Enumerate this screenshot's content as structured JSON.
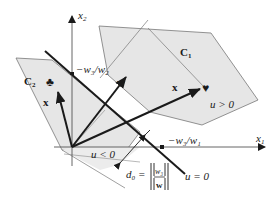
{
  "diagram": {
    "axes": {
      "x1_label": "x",
      "x1_sub": "1",
      "x2_label": "x",
      "x2_sub": "2"
    },
    "classes": {
      "c1_label": "C",
      "c1_sub": "1",
      "c2_label": "C",
      "c2_sub": "2"
    },
    "regions": {
      "positive": "u > 0",
      "negative": "u < 0",
      "boundary": "u = 0"
    },
    "vectors": {
      "weight": "w",
      "sample_c1": "x",
      "sample_c2": "x"
    },
    "markers": {
      "c1_symbol": "♥",
      "c2_symbol": "♣"
    },
    "intercepts": {
      "x2_intercept": "−w₃/w₂",
      "x1_intercept": "−w₃/w₁"
    },
    "distance": {
      "label": "d₀ =",
      "numerator": "w₃",
      "denominator": "w"
    },
    "colors": {
      "region_fill": "#e6e6e6",
      "line": "#1a1a1a",
      "thin_line": "#777777"
    }
  }
}
